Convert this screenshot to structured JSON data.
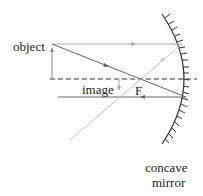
{
  "labels": {
    "object": "object",
    "image": "image",
    "focal_point": "F",
    "mirror_line1": "concave",
    "mirror_line2": "mirror"
  },
  "colors": {
    "ray_dark": "#666666",
    "ray_light": "#bbbbbb",
    "text": "#222222",
    "mirror": "#333333"
  }
}
